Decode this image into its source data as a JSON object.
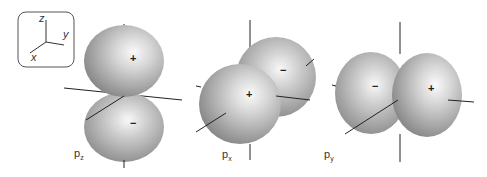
{
  "axes_key": {
    "z": "z",
    "y": "y",
    "x": "x"
  },
  "orbitals": [
    {
      "name": "p",
      "sub": "z",
      "lobe1_sign": "+",
      "lobe2_sign": "−"
    },
    {
      "name": "p",
      "sub": "x",
      "lobe1_sign": "+",
      "lobe2_sign": "−"
    },
    {
      "name": "p",
      "sub": "y",
      "lobe1_sign": "−",
      "lobe2_sign": "+"
    }
  ],
  "colors": {
    "lobe_light": "#f4f4f4",
    "lobe_mid": "#c8c8c8",
    "lobe_dark": "#8e8e8e",
    "axis": "#222222"
  }
}
